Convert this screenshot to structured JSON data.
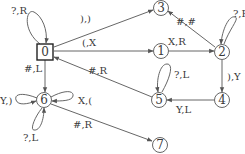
{
  "diagram": {
    "type": "state-machine",
    "start_state": "0",
    "nodes": [
      {
        "id": "0",
        "label": "0",
        "x": 45,
        "y": 52,
        "shape": "box"
      },
      {
        "id": "1",
        "label": "1",
        "x": 161,
        "y": 51,
        "shape": "circle"
      },
      {
        "id": "2",
        "label": "2",
        "x": 222,
        "y": 52,
        "shape": "circle"
      },
      {
        "id": "3",
        "label": "3",
        "x": 161,
        "y": 8,
        "shape": "circle"
      },
      {
        "id": "4",
        "label": "4",
        "x": 222,
        "y": 100,
        "shape": "circle"
      },
      {
        "id": "5",
        "label": "5",
        "x": 159,
        "y": 100,
        "shape": "circle"
      },
      {
        "id": "6",
        "label": "6",
        "x": 44,
        "y": 100,
        "shape": "circle"
      },
      {
        "id": "7",
        "label": "7",
        "x": 160,
        "y": 145,
        "shape": "circle"
      }
    ],
    "edges": [
      {
        "from": "0",
        "to": "0",
        "label": "?,R"
      },
      {
        "from": "0",
        "to": "3",
        "label": "),)"
      },
      {
        "from": "0",
        "to": "1",
        "label": "(,X"
      },
      {
        "from": "5",
        "to": "0",
        "label": "#,R"
      },
      {
        "from": "0",
        "to": "6",
        "label": "#,L"
      },
      {
        "from": "1",
        "to": "2",
        "label": "X,R"
      },
      {
        "from": "2",
        "to": "3",
        "label": "#,#"
      },
      {
        "from": "2",
        "to": "2",
        "label": "?,R"
      },
      {
        "from": "2",
        "to": "4",
        "label": "),Y"
      },
      {
        "from": "4",
        "to": "5",
        "label": "Y,L"
      },
      {
        "from": "5",
        "to": "5",
        "label": "?,L"
      },
      {
        "from": "6",
        "to": "6",
        "label": "Y,)"
      },
      {
        "from": "6",
        "to": "6",
        "label": "X,("
      },
      {
        "from": "6",
        "to": "6",
        "label": "?,L"
      },
      {
        "from": "6",
        "to": "7",
        "label": "#,R"
      }
    ]
  }
}
